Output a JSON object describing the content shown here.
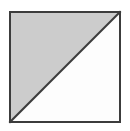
{
  "figure": {
    "description": "A square outlined in dark gray, split corner to corner by a diagonal line running from the bottom-left vertex to the top-right vertex. The upper-left triangle is shaded light gray; the lower-right triangle is unshaded white.",
    "canvas": {
      "width": 130,
      "height": 131,
      "background_color": "#ffffff"
    },
    "square": {
      "name": "outer-square",
      "x": 9,
      "y": 11,
      "width": 112,
      "height": 112,
      "border_color": "#3c3c3c",
      "border_width": 2,
      "fill_color": "#ffffff"
    },
    "diagonal": {
      "name": "diagonal-line",
      "from": "bottom-left",
      "to": "top-right",
      "x1": 9,
      "y1": 123,
      "x2": 121,
      "y2": 11,
      "color": "#3c3c3c",
      "width": 2
    },
    "regions": [
      {
        "name": "upper-left-triangle",
        "label": "shaded triangle",
        "fill_color": "#cccccc",
        "vertices": "9,11 121,11 9,123"
      },
      {
        "name": "lower-right-triangle",
        "label": "unshaded triangle",
        "fill_color": "#fdfdfd",
        "vertices": "121,11 121,123 9,123"
      }
    ]
  }
}
